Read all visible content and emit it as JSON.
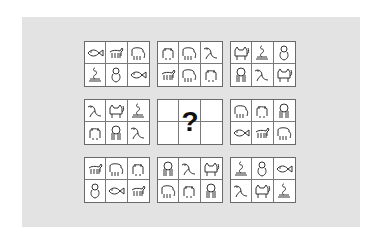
{
  "puzzle": {
    "type": "3x3 matrix reasoning puzzle",
    "background_color": "#e3e3e3",
    "panel_border_color": "#6a6a6a",
    "question_mark": "?",
    "panels": [
      {
        "row": 0,
        "col": 0,
        "cells": [
          "fish",
          "horse",
          "elephant",
          "snake",
          "monkey",
          "fish"
        ]
      },
      {
        "row": 0,
        "col": 1,
        "cells": [
          "bear",
          "elephant",
          "bird",
          "horse",
          "elephant",
          "bear"
        ]
      },
      {
        "row": 0,
        "col": 2,
        "cells": [
          "cat",
          "snake",
          "monkey",
          "lion",
          "bird",
          "cat"
        ]
      },
      {
        "row": 1,
        "col": 0,
        "cells": [
          "bird",
          "cat",
          "snake",
          "bear",
          "lion",
          "bird"
        ]
      },
      {
        "row": 1,
        "col": 1,
        "cells": [],
        "missing": true
      },
      {
        "row": 1,
        "col": 2,
        "cells": [
          "elephant",
          "bear",
          "lion",
          "fish",
          "horse",
          "elephant"
        ]
      },
      {
        "row": 2,
        "col": 0,
        "cells": [
          "horse",
          "elephant",
          "bear",
          "monkey",
          "fish",
          "horse"
        ]
      },
      {
        "row": 2,
        "col": 1,
        "cells": [
          "lion",
          "bird",
          "cat",
          "elephant",
          "bear",
          "lion"
        ]
      },
      {
        "row": 2,
        "col": 2,
        "cells": [
          "snake",
          "monkey",
          "fish",
          "bird",
          "cat",
          "snake"
        ]
      }
    ]
  }
}
